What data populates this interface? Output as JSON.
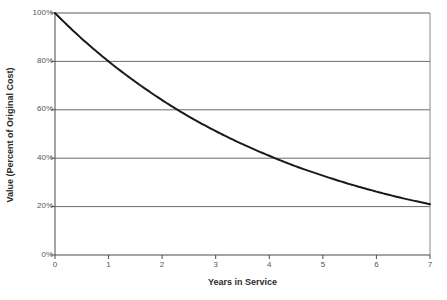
{
  "chart_data": {
    "type": "line",
    "title": "",
    "xlabel": "Years in Service",
    "ylabel": "Value (Percent of Original Cost)",
    "xlim": [
      0,
      7
    ],
    "ylim": [
      0,
      100
    ],
    "grid": true,
    "legend": "none",
    "x_ticks": [
      "0",
      "1",
      "2",
      "3",
      "4",
      "5",
      "6",
      "7"
    ],
    "y_ticks": [
      "0%",
      "20%",
      "40%",
      "60%",
      "80%",
      "100%"
    ],
    "x": [
      0,
      0.5,
      1,
      1.5,
      2,
      2.5,
      3,
      3.5,
      4,
      4.5,
      5,
      5.5,
      6,
      6.5,
      7
    ],
    "values": [
      100,
      89.4,
      80,
      71.6,
      64,
      57.2,
      51.2,
      45.8,
      41,
      36.6,
      32.8,
      29.3,
      26.2,
      23.4,
      21
    ],
    "series": [
      {
        "name": "Value",
        "color": "#1a1a1a",
        "values": [
          100,
          89.4,
          80,
          71.6,
          64,
          57.2,
          51.2,
          45.8,
          41,
          36.6,
          32.8,
          29.3,
          26.2,
          23.4,
          21
        ]
      }
    ],
    "annotations": []
  },
  "colors": {
    "curve": "#1a1a1a",
    "gridline": "#666666",
    "axis": "#555555",
    "text": "#2b2b2b",
    "background": "#ffffff"
  }
}
